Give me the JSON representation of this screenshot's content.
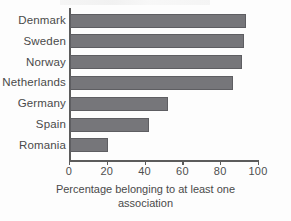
{
  "chart_data": {
    "type": "bar",
    "orientation": "horizontal",
    "title": "",
    "xlabel": "Percentage belonging to at least one association",
    "xlabel_lines": [
      "Percentage belonging to at least one",
      "association"
    ],
    "ylabel": "",
    "categories": [
      "Denmark",
      "Sweden",
      "Norway",
      "Netherlands",
      "Germany",
      "Spain",
      "Romania"
    ],
    "values": [
      93,
      92,
      91,
      86,
      52,
      42,
      20
    ],
    "xlim": [
      0,
      100
    ],
    "xticks": [
      0,
      20,
      40,
      60,
      80,
      100
    ],
    "xtick_labels": [
      "0",
      "20",
      "40",
      "60",
      "80",
      "100"
    ],
    "grid": false,
    "legend": false,
    "bar_color": "#76767a",
    "bar_edge_color": "#5e5e62",
    "axis_color": "#5c5c5c",
    "text_color": "#4a4a4a"
  }
}
